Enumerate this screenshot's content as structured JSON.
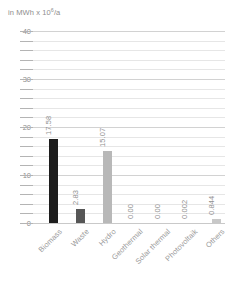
{
  "axis_unit": {
    "prefix": "in MWh x 10",
    "exponent": "6",
    "suffix": "/a",
    "full": "in MWh x 10^6/a"
  },
  "chart_data": {
    "type": "bar",
    "title": "",
    "subtitle": "",
    "xlabel": "",
    "ylabel": "in MWh x 10^6/a",
    "ylim": [
      0,
      40
    ],
    "y_major_ticks": [
      0,
      10,
      20,
      30,
      40
    ],
    "y_minor_step": 2,
    "grid": true,
    "legend": "none",
    "categories": [
      "Biomass",
      "Waste",
      "Hydro",
      "Geothermal",
      "Solar thermal",
      "Photovoltaik",
      "Others"
    ],
    "values": [
      17.58,
      2.83,
      15.07,
      0.0,
      0.0,
      0.002,
      0.844
    ],
    "value_labels": [
      "17.58",
      "2.83",
      "15.07",
      "0.00",
      "0.00",
      "0.002",
      "0.844"
    ],
    "bar_colors": [
      "#1d1d1d",
      "#565656",
      "#b8b8b8",
      "#c8c8c8",
      "#c8c8c8",
      "#c8c8c8",
      "#c8c8c8"
    ]
  },
  "colors": {
    "background": "#ffffff",
    "gridline": "#e6e6e6",
    "gridline_major": "#d2d2d2",
    "axis": "#c9c9c9",
    "text": "#8e8e8e"
  }
}
